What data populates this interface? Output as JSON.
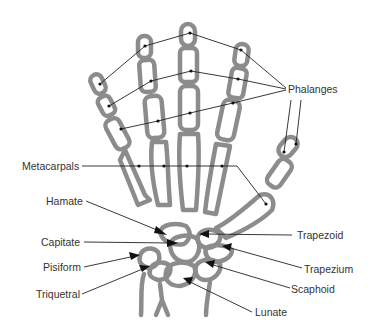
{
  "diagram": {
    "labels": {
      "phalanges": "Phalanges",
      "metacarpals": "Metacarpals",
      "hamate": "Hamate",
      "capitate": "Capitate",
      "pisiform": "Pisiform",
      "triquetral": "Triquetral",
      "trapezoid": "Trapezoid",
      "trapezium": "Trapezium",
      "scaphoid": "Scaphoid",
      "lunate": "Lunate"
    },
    "colors": {
      "bone_outline": "#8c8c8c",
      "leader_line": "#222222",
      "text": "#333333",
      "background": "#ffffff"
    }
  }
}
